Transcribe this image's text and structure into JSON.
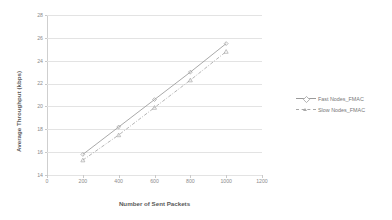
{
  "chart_data": {
    "type": "line",
    "title": "",
    "xlabel": "Number of Sent Packets",
    "ylabel": "Average Throughput (kbps)",
    "x": [
      200,
      400,
      600,
      800,
      1000
    ],
    "xlim": [
      0,
      1200
    ],
    "ylim": [
      14,
      28
    ],
    "xticks": [
      0,
      200,
      400,
      600,
      800,
      1000,
      1200
    ],
    "yticks": [
      14,
      16,
      18,
      20,
      22,
      24,
      26,
      28
    ],
    "grid": true,
    "legend_position": "right",
    "series": [
      {
        "name": "Fast Nodes_FMAC",
        "values": [
          15.8,
          18.2,
          20.6,
          23.0,
          25.5
        ],
        "color": "#9a9a9a",
        "style": "solid",
        "marker": "diamond"
      },
      {
        "name": "Slow Nodes_FMAC",
        "values": [
          15.3,
          17.5,
          19.9,
          22.3,
          24.8
        ],
        "color": "#a8a8a8",
        "style": "dashed",
        "marker": "triangle"
      }
    ]
  },
  "axes": {
    "x_tick_labels": [
      "0",
      "200",
      "400",
      "600",
      "800",
      "1000",
      "1200"
    ],
    "y_tick_labels": [
      "14",
      "16",
      "18",
      "20",
      "22",
      "24",
      "26",
      "28"
    ],
    "x_title": "Number of Sent Packets",
    "y_title": "Average Throughput (kbps)"
  },
  "legend": {
    "items": [
      {
        "label": "Fast Nodes_FMAC"
      },
      {
        "label": "Slow Nodes_FMAC"
      }
    ]
  },
  "colors": {
    "grid": "#e3e3e3",
    "axis": "#cfcfcf",
    "tick_text": "#8c8c8c",
    "title_text": "#5a5a5a",
    "series1": "#9a9a9a",
    "series2": "#a8a8a8",
    "background": "#ffffff"
  }
}
